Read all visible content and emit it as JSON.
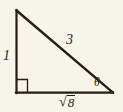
{
  "figure": {
    "kind": "right-triangle-diagram",
    "background_color": "#f7f4e9",
    "ink_color": "#231f18",
    "stroke_width": 2
  },
  "geometry": {
    "apex": {
      "x": 16,
      "y": 10
    },
    "right_angle_vertex": {
      "x": 16,
      "y": 93
    },
    "theta_vertex": {
      "x": 113,
      "y": 93
    },
    "right_angle_marker": {
      "x": 17,
      "y": 79,
      "size": 11
    }
  },
  "labels": {
    "vertical_leg": "1",
    "hypotenuse": "3",
    "angle": "θ",
    "base_radical_sign": "√",
    "base_radicand": "8",
    "base_full": "√8"
  }
}
